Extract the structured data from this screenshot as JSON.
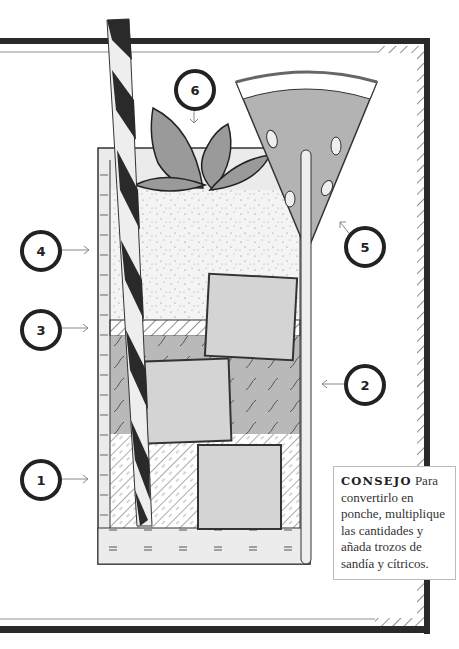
{
  "illustration": {
    "subject": "cocktail-glass-with-watermelon",
    "colors": {
      "frame": "#2a2a2a",
      "glass_fill": "#ebebeb",
      "liquid_mid": "#b8b8b8",
      "ice": "#d4d4d4",
      "watermelon_flesh": "#b3b3b3",
      "leaves": "#999999",
      "outline": "#333333"
    },
    "callouts": [
      {
        "number": "1",
        "label": "1"
      },
      {
        "number": "2",
        "label": "2"
      },
      {
        "number": "3",
        "label": "3"
      },
      {
        "number": "4",
        "label": "4"
      },
      {
        "number": "5",
        "label": "5"
      },
      {
        "number": "6",
        "label": "6"
      }
    ]
  },
  "tip": {
    "heading": "CONSEJO",
    "body": "Para convertirlo en ponche, multiplique las cantidades y añada trozos de sandía y cítricos."
  }
}
